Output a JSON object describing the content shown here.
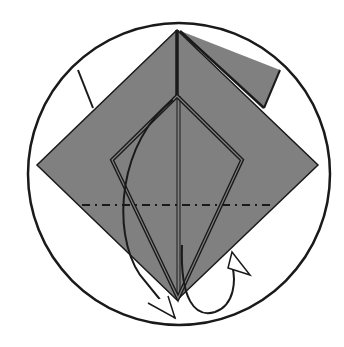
{
  "diagram": {
    "type": "origami-folding-step",
    "colors": {
      "background": "#ffffff",
      "paper_colored_side": "#808080",
      "line": "#1a1a1a"
    },
    "elements": {
      "frame": "circle",
      "paper": "square-base-diamond",
      "kite_outline": "kite-shape-folded-flaps",
      "fold_line": "mountain-fold-dash-dot",
      "arrows": [
        "fold-behind-arrow",
        "unfold-arrow"
      ]
    }
  }
}
